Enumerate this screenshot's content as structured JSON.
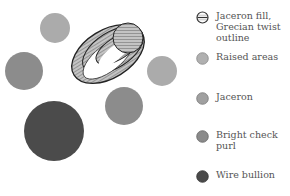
{
  "legend": {
    "items": [
      {
        "label": "Jaceron fill, Grecian twist outline",
        "icon": "hatched-circle",
        "color": "#b5b5b5"
      },
      {
        "label": "Raised areas",
        "icon": "filled-circle",
        "color": "#b0b0b0"
      },
      {
        "label": "Jaceron",
        "icon": "filled-circle",
        "color": "#a0a0a0"
      },
      {
        "label": "Bright check purl",
        "icon": "filled-circle",
        "color": "#8a8a8a"
      },
      {
        "label": "Wire bullion",
        "icon": "filled-circle",
        "color": "#4a4a4a"
      }
    ]
  },
  "shapes": {
    "raised_area_circles": {
      "color": "#ababab"
    },
    "bright_check_purl_circles": {
      "color": "#8c8c8c"
    },
    "wire_bullion_circle": {
      "color": "#4b4b4b"
    },
    "jaceron_ellipse": {
      "fill": "#bdbdbd",
      "outline": "#222222"
    }
  }
}
